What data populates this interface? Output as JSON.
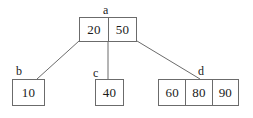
{
  "diagram": {
    "type": "b-tree",
    "background_color": "#ffffff",
    "border_color": "#6b6b6b",
    "text_color": "#1a1a1a",
    "nodes": [
      {
        "id": "a",
        "label": "a",
        "role": "root",
        "keys": [
          "20",
          "50"
        ]
      },
      {
        "id": "b",
        "label": "b",
        "role": "leaf",
        "keys": [
          "10"
        ]
      },
      {
        "id": "c",
        "label": "c",
        "role": "leaf",
        "keys": [
          "40"
        ]
      },
      {
        "id": "d",
        "label": "d",
        "role": "leaf",
        "keys": [
          "60",
          "80",
          "90"
        ]
      }
    ],
    "edges": [
      {
        "from": "a",
        "to": "b",
        "x1": 79,
        "y1": 41,
        "x2": 37,
        "y2": 79
      },
      {
        "from": "a",
        "to": "c",
        "x1": 108,
        "y1": 41,
        "x2": 108,
        "y2": 79
      },
      {
        "from": "a",
        "to": "d",
        "x1": 137,
        "y1": 41,
        "x2": 200,
        "y2": 79
      }
    ]
  }
}
